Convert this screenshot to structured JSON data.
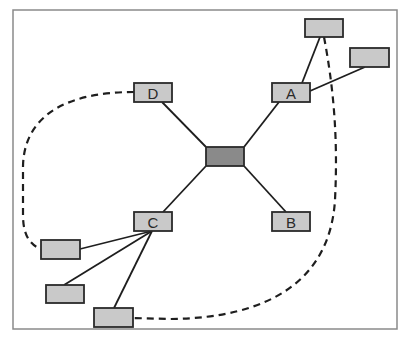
{
  "diagram": {
    "type": "network-topology",
    "frame": {
      "x": 13,
      "y": 10,
      "width": 384,
      "height": 319
    },
    "colors": {
      "node_fill": "#c9c9c9",
      "hub_fill": "#8a8a8a",
      "stroke": "#2a2a2a",
      "frame_stroke": "#8a8a8a"
    },
    "nodes": [
      {
        "id": "hub",
        "label": "",
        "x": 206,
        "y": 147,
        "w": 38,
        "h": 19,
        "kind": "hub"
      },
      {
        "id": "A",
        "label": "A",
        "x": 272,
        "y": 83,
        "w": 38,
        "h": 19,
        "kind": "node"
      },
      {
        "id": "B",
        "label": "B",
        "x": 272,
        "y": 212,
        "w": 38,
        "h": 19,
        "kind": "node"
      },
      {
        "id": "C",
        "label": "C",
        "x": 134,
        "y": 212,
        "w": 38,
        "h": 19,
        "kind": "node"
      },
      {
        "id": "D",
        "label": "D",
        "x": 134,
        "y": 83,
        "w": 38,
        "h": 19,
        "kind": "node"
      },
      {
        "id": "A1",
        "label": "",
        "x": 305,
        "y": 19,
        "w": 38,
        "h": 18,
        "kind": "leaf"
      },
      {
        "id": "A2",
        "label": "",
        "x": 350,
        "y": 48,
        "w": 39,
        "h": 19,
        "kind": "leaf"
      },
      {
        "id": "C1",
        "label": "",
        "x": 41,
        "y": 240,
        "w": 39,
        "h": 19,
        "kind": "leaf"
      },
      {
        "id": "C2",
        "label": "",
        "x": 46,
        "y": 285,
        "w": 38,
        "h": 18,
        "kind": "leaf"
      },
      {
        "id": "C3",
        "label": "",
        "x": 94,
        "y": 308,
        "w": 39,
        "h": 19,
        "kind": "leaf"
      }
    ],
    "edges": [
      {
        "from": "hub",
        "to": "A",
        "style": "solid"
      },
      {
        "from": "hub",
        "to": "B",
        "style": "solid"
      },
      {
        "from": "hub",
        "to": "C",
        "style": "solid"
      },
      {
        "from": "hub",
        "to": "D",
        "style": "solid"
      },
      {
        "from": "A",
        "to": "A1",
        "style": "solid"
      },
      {
        "from": "A",
        "to": "A2",
        "style": "solid"
      },
      {
        "from": "C",
        "to": "C1",
        "style": "solid"
      },
      {
        "from": "C",
        "to": "C2",
        "style": "solid"
      },
      {
        "from": "C",
        "to": "C3",
        "style": "solid"
      },
      {
        "from": "D",
        "to": "C1",
        "style": "dashed"
      },
      {
        "from": "A1",
        "to": "C3",
        "style": "dashed"
      }
    ]
  }
}
